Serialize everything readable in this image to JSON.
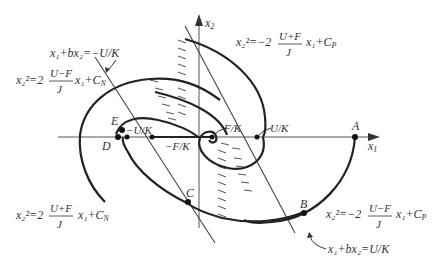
{
  "axes": {
    "x_label": "x",
    "x_sub": "1",
    "y_label": "x",
    "y_sub": "2"
  },
  "points": {
    "A": "A",
    "B": "B",
    "C": "C",
    "D": "D",
    "E": "E"
  },
  "axis_marks": {
    "neg_u_over_k": "−U/K",
    "neg_f_over_k": "−F/K",
    "f_over_k": "F/K",
    "u_over_k": "U/K"
  },
  "equations": {
    "top_right": {
      "lhs": "x₂²=−2",
      "num": "U+F",
      "den": "J",
      "rhs": "x₁+C",
      "sub": "P"
    },
    "top_left": {
      "lhs": "x₂²=2",
      "num": "U−F",
      "den": "J",
      "rhs": "x₁+C",
      "sub": "N"
    },
    "bottom_left": {
      "lhs": "x₂²=2",
      "num": "U+F",
      "den": "J",
      "rhs": "x₁+C",
      "sub": "N"
    },
    "bottom_right": {
      "lhs": "x₂²=−2",
      "num": "U−F",
      "den": "J",
      "rhs": "x₁+C",
      "sub": "P"
    },
    "switch_left": "x₁+bx₂=−U/K",
    "switch_right": "x₁+bx₂=U/K"
  }
}
